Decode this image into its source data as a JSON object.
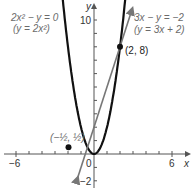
{
  "chart_data": {
    "type": "line",
    "title": "",
    "xlabel": "x",
    "ylabel": "y",
    "xlim": [
      -6.7,
      7.2
    ],
    "ylim": [
      -2.6,
      11.2
    ],
    "x_ticks_labeled": [
      -6,
      0,
      6
    ],
    "y_ticks_labeled": [
      10,
      -2
    ],
    "grid": false,
    "series": [
      {
        "name": "2x^2 - y = 0 (y = 2x^2)",
        "equation": "y = 2x^2",
        "color": "#111111",
        "type": "parabola"
      },
      {
        "name": "3x - y = -2 (y = 3x + 2)",
        "equation": "y = 3x + 2",
        "color": "#777777",
        "type": "line"
      }
    ],
    "points": [
      {
        "label": "(2, 8)",
        "x": 2,
        "y": 8
      },
      {
        "label": "(-1/2, 1/2)",
        "x": -0.5,
        "y": 0.5
      }
    ]
  },
  "labels": {
    "parabola_eq1": "2x² − y = 0",
    "parabola_eq2": "(y = 2x²)",
    "line_eq1": "3x − y = −2",
    "line_eq2": "(y = 3x + 2)",
    "point1": "(2, 8)",
    "point2": "(−½, ½)",
    "x_axis": "x",
    "y_axis": "y",
    "tick_neg6": "−6",
    "tick_0": "0",
    "tick_6": "6",
    "tick_10": "10",
    "tick_neg2": "−2"
  }
}
